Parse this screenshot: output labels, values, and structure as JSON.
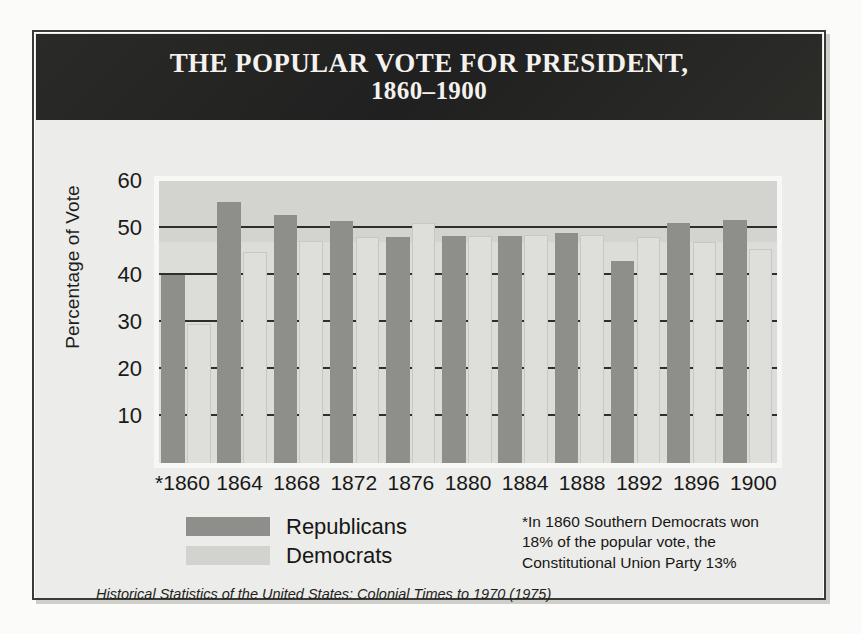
{
  "figure": {
    "title_line_1": "THE POPULAR VOTE FOR PRESIDENT,",
    "title_line_2": "1860–1900",
    "source_note": "Historical Statistics of  the United States: Colonial Times to 1970 (1975)",
    "footnote": "*In 1860 Southern Democrats won 18% of the popular vote, the Constitutional Union Party 13%"
  },
  "legend": {
    "items": [
      {
        "label": "Republicans",
        "color": "#8e8e8a"
      },
      {
        "label": "Democrats",
        "color": "#d2d2ce"
      }
    ]
  },
  "axes": {
    "y_title": "Percentage of Vote",
    "y_ticks": [
      "60",
      "50",
      "40",
      "30",
      "20",
      "10"
    ],
    "x_ticks": [
      "*1860",
      "1864",
      "1868",
      "1872",
      "1876",
      "1880",
      "1884",
      "1888",
      "1892",
      "1896",
      "1900"
    ]
  },
  "colors": {
    "republican": "#8e8e8a",
    "democrat": "#dededa",
    "plot_background_upper": "#d3d3cf",
    "plot_background_lower": "#dcdcd8",
    "title_background": "#262624",
    "title_text": "#f4f2ee",
    "gridline": "#2e2e2c",
    "page_background": "#fbfbfa",
    "frame_background": "#e9e9e6"
  },
  "chart_data": {
    "type": "bar",
    "title": "The Popular Vote for President, 1860–1900",
    "xlabel": "",
    "ylabel": "Percentage of Vote",
    "ylim": [
      0,
      60
    ],
    "yticks": [
      10,
      20,
      30,
      40,
      50,
      60
    ],
    "grid": true,
    "gridlines_at": [
      10,
      20,
      30,
      40,
      50
    ],
    "legend_position": "below-left",
    "categories": [
      "*1860",
      "1864",
      "1868",
      "1872",
      "1876",
      "1880",
      "1884",
      "1888",
      "1892",
      "1896",
      "1900"
    ],
    "series": [
      {
        "name": "Republicans",
        "color": "#8e8e8a",
        "values": [
          40.0,
          55.5,
          52.7,
          51.5,
          48.0,
          48.3,
          48.3,
          49.0,
          43.0,
          51.0,
          51.7
        ]
      },
      {
        "name": "Democrats",
        "color": "#dededa",
        "values": [
          29.5,
          45.0,
          47.3,
          48.0,
          51.0,
          48.2,
          48.5,
          48.6,
          48.0,
          47.0,
          45.5
        ]
      }
    ],
    "annotations": [
      "*In 1860 Southern Democrats won 18% of the popular vote, the Constitutional Union Party 13%"
    ],
    "source": "Historical Statistics of  the United States: Colonial Times to 1970 (1975)"
  }
}
